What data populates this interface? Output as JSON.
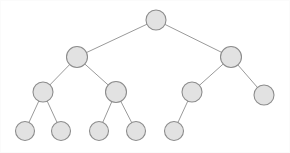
{
  "figure": {
    "width": 290,
    "height": 153,
    "background_color": "#ffffff",
    "node_fill_color": "#e2e2e2",
    "node_stroke_color": "#8c8c8c",
    "edge_color": "#9a9a9a",
    "node_radius": 10,
    "leaf_radius": 9.5
  },
  "tree": {
    "type": "binary-tree",
    "depth": 4,
    "node_count": 12,
    "leaf_count": 7,
    "nodes": [
      {
        "id": "n0",
        "label": "",
        "level": 0,
        "x": 156,
        "y": 20,
        "r": 10,
        "parent": null
      },
      {
        "id": "n1",
        "label": "",
        "level": 1,
        "x": 77,
        "y": 57,
        "r": 10.5,
        "parent": "n0"
      },
      {
        "id": "n2",
        "label": "",
        "level": 1,
        "x": 231,
        "y": 57,
        "r": 10.5,
        "parent": "n0"
      },
      {
        "id": "n3",
        "label": "",
        "level": 2,
        "x": 43,
        "y": 92,
        "r": 10,
        "parent": "n1"
      },
      {
        "id": "n4",
        "label": "",
        "level": 2,
        "x": 116,
        "y": 92,
        "r": 10.5,
        "parent": "n1"
      },
      {
        "id": "n5",
        "label": "",
        "level": 2,
        "x": 192,
        "y": 92,
        "r": 10,
        "parent": "n2"
      },
      {
        "id": "n6",
        "label": "",
        "level": 2,
        "x": 264,
        "y": 95,
        "r": 10,
        "parent": "n2"
      },
      {
        "id": "n7",
        "label": "",
        "level": 3,
        "x": 25,
        "y": 131,
        "r": 9.5,
        "parent": "n3"
      },
      {
        "id": "n8",
        "label": "",
        "level": 3,
        "x": 61,
        "y": 131,
        "r": 9.5,
        "parent": "n3"
      },
      {
        "id": "n9",
        "label": "",
        "level": 3,
        "x": 99,
        "y": 131,
        "r": 9.5,
        "parent": "n4"
      },
      {
        "id": "n10",
        "label": "",
        "level": 3,
        "x": 136,
        "y": 131,
        "r": 9.5,
        "parent": "n4"
      },
      {
        "id": "n11",
        "label": "",
        "level": 3,
        "x": 174,
        "y": 131,
        "r": 9.5,
        "parent": "n5"
      }
    ],
    "edges": [
      {
        "from": "n0",
        "to": "n1"
      },
      {
        "from": "n0",
        "to": "n2"
      },
      {
        "from": "n1",
        "to": "n3"
      },
      {
        "from": "n1",
        "to": "n4"
      },
      {
        "from": "n2",
        "to": "n5"
      },
      {
        "from": "n2",
        "to": "n6"
      },
      {
        "from": "n3",
        "to": "n7"
      },
      {
        "from": "n3",
        "to": "n8"
      },
      {
        "from": "n4",
        "to": "n9"
      },
      {
        "from": "n4",
        "to": "n10"
      },
      {
        "from": "n5",
        "to": "n11"
      }
    ]
  }
}
